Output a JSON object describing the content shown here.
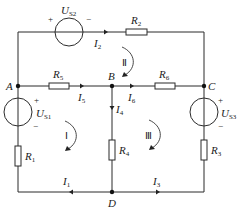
{
  "colors": {
    "wire": "#2b2b2b",
    "background": "#ffffff",
    "text": "#222222"
  },
  "nodes": {
    "A": "A",
    "B": "B",
    "C": "C",
    "D": "D"
  },
  "sources": {
    "US1": {
      "symbol": "U",
      "subscript": "S1",
      "plus": "+",
      "minus": "−"
    },
    "US2": {
      "symbol": "U",
      "subscript": "S2",
      "plus": "+",
      "minus": "−"
    },
    "US3": {
      "symbol": "U",
      "subscript": "S3",
      "plus": "+",
      "minus": "−"
    }
  },
  "resistors": {
    "R1": {
      "symbol": "R",
      "subscript": "1"
    },
    "R2": {
      "symbol": "R",
      "subscript": "2"
    },
    "R3": {
      "symbol": "R",
      "subscript": "3"
    },
    "R4": {
      "symbol": "R",
      "subscript": "4"
    },
    "R5": {
      "symbol": "R",
      "subscript": "5"
    },
    "R6": {
      "symbol": "R",
      "subscript": "6"
    }
  },
  "currents": {
    "I1": {
      "symbol": "I",
      "subscript": "1"
    },
    "I2": {
      "symbol": "I",
      "subscript": "2"
    },
    "I3": {
      "symbol": "I",
      "subscript": "3"
    },
    "I4": {
      "symbol": "I",
      "subscript": "4"
    },
    "I5": {
      "symbol": "I",
      "subscript": "5"
    },
    "I6": {
      "symbol": "I",
      "subscript": "6"
    }
  },
  "loops": {
    "loop1": "Ⅰ",
    "loop2": "Ⅱ",
    "loop3": "Ⅲ"
  }
}
